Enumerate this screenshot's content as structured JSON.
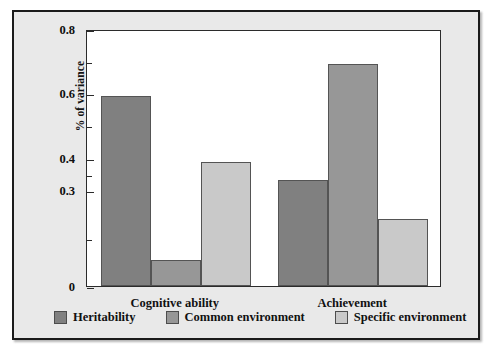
{
  "chart_data": {
    "type": "bar",
    "title": "",
    "subtitle": "",
    "xlabel": "",
    "ylabel": "% of variance",
    "categories": [
      "Cognitive ability",
      "Achievement"
    ],
    "series": [
      {
        "name": "Heritability",
        "values": [
          0.59,
          0.33
        ],
        "color": "#808080"
      },
      {
        "name": "Common environment",
        "values": [
          0.08,
          0.69
        ],
        "color": "#979797"
      },
      {
        "name": "Specific environment",
        "values": [
          0.385,
          0.21
        ],
        "color": "#c9c9c9"
      }
    ],
    "ylim": [
      0,
      0.8
    ],
    "y_tick_labels": [
      "0.8",
      "0.6",
      "0.4",
      "0.3",
      "0"
    ],
    "y_tick_values": [
      0.8,
      0.6,
      0.4,
      0.3,
      0.0
    ],
    "y_minor_tick_values": [
      0.7,
      0.5,
      0.35,
      0.15
    ],
    "grid": false,
    "legend_position": "bottom",
    "legend_entries": [
      "Heritability",
      "Common environment",
      "Specific environment"
    ]
  },
  "figure": {
    "frame_color": "#1b1b1b",
    "background_color": "#e9e9e9",
    "plot_background_color": "#ffffff"
  }
}
